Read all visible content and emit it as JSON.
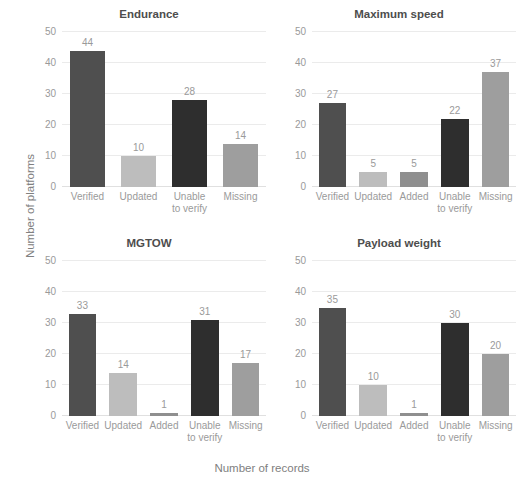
{
  "chart_data": {
    "type": "bar",
    "title": "",
    "xlabel": "Number of records",
    "ylabel": "Number of platforms",
    "ylim": [
      0,
      50
    ],
    "yticks": [
      0,
      10,
      20,
      30,
      40,
      50
    ],
    "grid": true,
    "legend": "none",
    "layout": "2x2 small multiples",
    "category_colors": {
      "Verified": "#4f4f4f",
      "Updated": "#bdbdbd",
      "Added": "#8f8f8f",
      "Unable to verify": "#2e2e2e",
      "Missing": "#9e9e9e"
    },
    "panels": [
      {
        "title": "Endurance",
        "categories": [
          "Verified",
          "Updated",
          "Unable\nto verify",
          "Missing"
        ],
        "category_keys": [
          "Verified",
          "Updated",
          "Unable to verify",
          "Missing"
        ],
        "values": [
          44,
          10,
          28,
          14
        ],
        "labels": [
          "44",
          "10",
          "28",
          "14"
        ]
      },
      {
        "title": "Maximum speed",
        "categories": [
          "Verified",
          "Updated",
          "Added",
          "Unable\nto verify",
          "Missing"
        ],
        "category_keys": [
          "Verified",
          "Updated",
          "Added",
          "Unable to verify",
          "Missing"
        ],
        "values": [
          27,
          5,
          5,
          22,
          37
        ],
        "labels": [
          "27",
          "5",
          "5",
          "22",
          "37"
        ]
      },
      {
        "title": "MGTOW",
        "categories": [
          "Verified",
          "Updated",
          "Added",
          "Unable\nto verify",
          "Missing"
        ],
        "category_keys": [
          "Verified",
          "Updated",
          "Added",
          "Unable to verify",
          "Missing"
        ],
        "values": [
          33,
          14,
          1,
          31,
          17
        ],
        "labels": [
          "33",
          "14",
          "1",
          "31",
          "17"
        ]
      },
      {
        "title": "Payload weight",
        "categories": [
          "Verified",
          "Updated",
          "Added",
          "Unable\nto verify",
          "Missing"
        ],
        "category_keys": [
          "Verified",
          "Updated",
          "Added",
          "Unable to verify",
          "Missing"
        ],
        "values": [
          35,
          10,
          1,
          30,
          20
        ],
        "labels": [
          "35",
          "10",
          "1",
          "30",
          "20"
        ]
      }
    ]
  }
}
